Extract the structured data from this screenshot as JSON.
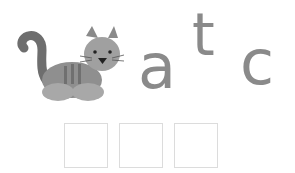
{
  "picture": {
    "icon": "cat-icon",
    "label": "cat"
  },
  "letters": [
    {
      "char": "a"
    },
    {
      "char": "t"
    },
    {
      "char": "c"
    }
  ],
  "answer_slots": [
    {
      "value": ""
    },
    {
      "value": ""
    },
    {
      "value": ""
    }
  ],
  "colors": {
    "letter": "#8a8a8a",
    "slot_border": "#dcdcdc",
    "cat_body": "#9a9a9a",
    "cat_dark": "#6e6e6e"
  }
}
